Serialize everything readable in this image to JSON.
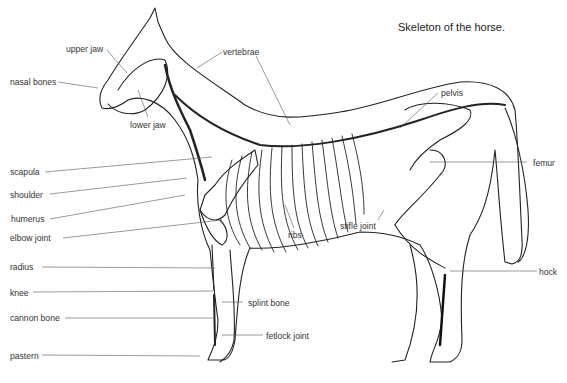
{
  "title": "Skeleton of the horse.",
  "labels": {
    "upper_jaw": "upper jaw",
    "nasal_bones": "nasal bones",
    "lower_jaw": "lower jaw",
    "vertebrae": "vertebrae",
    "pelvis": "pelvis",
    "femur": "femur",
    "scapula": "scapula",
    "shoulder": "shoulder",
    "humerus": "humerus",
    "elbow_joint": "elbow joint",
    "radius": "radius",
    "ribs": "ribs",
    "stifle_joint": "stifle joint",
    "knee": "knee",
    "cannon_bone": "cannon bone",
    "splint_bone": "splint bone",
    "fetlock_joint": "fetlock joint",
    "pastern": "pastern",
    "hock": "hock"
  },
  "colors": {
    "line": "#222222",
    "leader": "#555555",
    "bone_dark": "#111111"
  }
}
